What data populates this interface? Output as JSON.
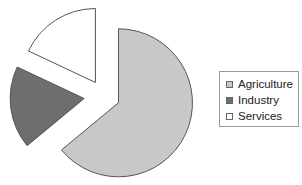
{
  "chart_data": {
    "type": "pie",
    "title": "",
    "exploded": true,
    "slices": [
      {
        "label": "Agriculture",
        "value": 64,
        "color": "#c8c8c8"
      },
      {
        "label": "Industry",
        "value": 18,
        "color": "#6e6e6e"
      },
      {
        "label": "Services",
        "value": 18,
        "color": "#ffffff"
      }
    ],
    "legend": {
      "position": "right",
      "entries": [
        "Agriculture",
        "Industry",
        "Services"
      ]
    }
  }
}
